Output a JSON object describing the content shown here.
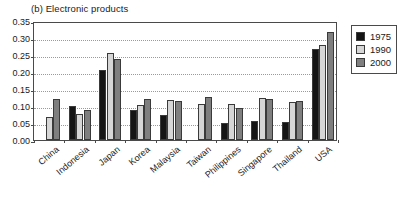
{
  "chart_data": {
    "type": "bar",
    "title": "(b) Electronic products",
    "xlabel": "",
    "ylabel": "",
    "ylim": [
      0.0,
      0.35
    ],
    "ytick_labels": [
      "0.00",
      "0.05",
      "0.10",
      "0.15",
      "0.20",
      "0.25",
      "0.30",
      "0.35"
    ],
    "ytick_values": [
      0.0,
      0.05,
      0.1,
      0.15,
      0.2,
      0.25,
      0.3,
      0.35
    ],
    "grid": true,
    "grid_style": "dotted-horizontal",
    "legend_position": "outside-right-top",
    "categories": [
      "China",
      "Indonesia",
      "Japan",
      "Korea",
      "Malaysia",
      "Taiwan",
      "Philippines",
      "Singapore",
      "Thailand",
      "USA"
    ],
    "series": [
      {
        "name": "1975",
        "color": "#151515",
        "values": [
          null,
          0.1,
          0.205,
          0.089,
          0.073,
          null,
          0.05,
          0.056,
          0.053,
          0.269
        ]
      },
      {
        "name": "1990",
        "color": "#d6d6d6",
        "values": [
          0.067,
          0.076,
          0.255,
          0.102,
          0.119,
          0.105,
          0.105,
          0.125,
          0.111,
          0.28
        ]
      },
      {
        "name": "2000",
        "color": "#7f7f7f",
        "values": [
          0.122,
          0.087,
          0.239,
          0.122,
          0.116,
          0.127,
          0.095,
          0.122,
          0.116,
          0.319
        ]
      }
    ]
  },
  "legend": {
    "entries": [
      {
        "label": "1975",
        "swatch": "legend-swatch-1975"
      },
      {
        "label": "1990",
        "swatch": "legend-swatch-1990"
      },
      {
        "label": "2000",
        "swatch": "legend-swatch-2000"
      }
    ]
  }
}
